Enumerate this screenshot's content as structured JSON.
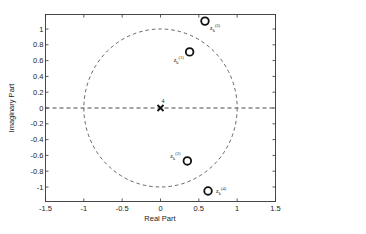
{
  "chart_data": {
    "type": "scatter",
    "title": "",
    "xlabel": "Real Part",
    "ylabel": "Imaginary Part",
    "xlim": [
      -1.5,
      1.5
    ],
    "ylim": [
      -1.2,
      1.2
    ],
    "grid": false,
    "x_ticks": [
      -1.5,
      -1,
      -0.5,
      0,
      0.5,
      1,
      1.5
    ],
    "x_tick_labels": [
      "-1.5",
      "-1",
      "-0.5",
      "0",
      "0.5",
      "1",
      "1.5"
    ],
    "y_ticks": [
      -1,
      -0.8,
      -0.6,
      -0.4,
      -0.2,
      0,
      0.2,
      0.4,
      0.6,
      0.8,
      1
    ],
    "y_tick_labels": [
      "-1",
      "-0.8",
      "-0.6",
      "-0.4",
      "-0.2",
      "0",
      "0.2",
      "0.4",
      "0.6",
      "0.8",
      "1"
    ],
    "unit_circle": {
      "style": "dashed",
      "radius": 1
    },
    "real_axis_line": {
      "style": "dashed",
      "y": 0
    },
    "series": [
      {
        "name": "zeros",
        "marker": "o",
        "points": [
          {
            "x": 0.38,
            "y": 0.71,
            "label": "z_k^(1)"
          },
          {
            "x": 0.35,
            "y": -0.67,
            "label": "z_k^(2)"
          },
          {
            "x": 0.58,
            "y": 1.1,
            "label": "z_k^(3)"
          },
          {
            "x": 0.62,
            "y": -1.05,
            "label": "z_k^(4)"
          }
        ]
      },
      {
        "name": "poles",
        "marker": "x",
        "points": [
          {
            "x": 0,
            "y": 0,
            "label": "4"
          }
        ]
      }
    ],
    "legend": null
  }
}
